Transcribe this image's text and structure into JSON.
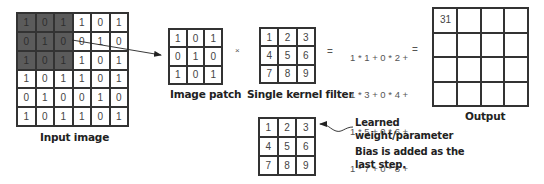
{
  "input_image": {
    "label": "Input image",
    "rows": [
      [
        "1",
        "0",
        "1",
        "1",
        "0",
        "1"
      ],
      [
        "0",
        "1",
        "0",
        "0",
        "1",
        "0"
      ],
      [
        "1",
        "0",
        "1",
        "1",
        "0",
        "1"
      ],
      [
        "1",
        "0",
        "1",
        "1",
        "0",
        "1"
      ],
      [
        "0",
        "1",
        "0",
        "0",
        "1",
        "0"
      ],
      [
        "1",
        "0",
        "1",
        "1",
        "0",
        "1"
      ]
    ],
    "highlight": "top-left 3x3"
  },
  "image_patch": {
    "label": "Image patch",
    "rows": [
      [
        "1",
        "0",
        "1"
      ],
      [
        "0",
        "1",
        "0"
      ],
      [
        "1",
        "0",
        "1"
      ]
    ]
  },
  "operators": {
    "multiply": "×",
    "equals_1": "=",
    "equals_2": "="
  },
  "kernel_filter": {
    "label": "Single kernel filter",
    "rows": [
      [
        "1",
        "2",
        "3"
      ],
      [
        "4",
        "5",
        "6"
      ],
      [
        "7",
        "8",
        "9"
      ]
    ]
  },
  "formula": {
    "lines": [
      "1 * 1 + 0 * 2 +",
      "1 * 3 + 0 * 4 +",
      "1 * 5 + 0 * 6 +",
      "1 * 7 + 0 * 8 +",
      "1 * 9 + bias"
    ]
  },
  "output": {
    "label": "Output",
    "rows": [
      [
        "31",
        "",
        "",
        ""
      ],
      [
        "",
        "",
        "",
        ""
      ],
      [
        "",
        "",
        "",
        ""
      ],
      [
        "",
        "",
        "",
        ""
      ]
    ]
  },
  "learned_kernel": {
    "rows": [
      [
        "1",
        "2",
        "3"
      ],
      [
        "4",
        "5",
        "6"
      ],
      [
        "7",
        "8",
        "9"
      ]
    ],
    "note_1_line_1": "Learned",
    "note_1_line_2": "weight/parameter",
    "note_2_line_1": "Bias is added as the",
    "note_2_line_2": "last step."
  },
  "colors": {
    "highlight": "#5b5b5b",
    "grid_line": "#333333",
    "text": "#444444"
  }
}
